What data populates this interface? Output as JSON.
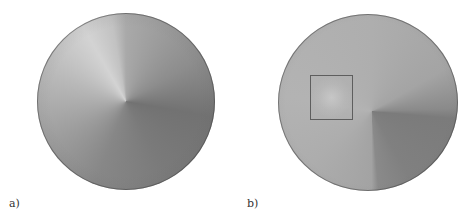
{
  "figure": {
    "panels": [
      {
        "label": "a)",
        "description": "Circular sample with smooth conical brightness gradient; darker quadrant at lower right"
      },
      {
        "label": "b)",
        "description": "Circular sample with sharper dark lower-right quadrant and a highlighted square region of interest",
        "roi_box": {
          "present": true
        }
      }
    ]
  }
}
